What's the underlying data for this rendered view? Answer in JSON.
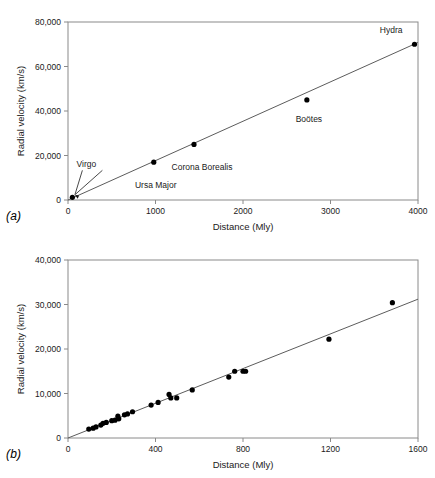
{
  "figure": {
    "panel_a_tag": "(a)",
    "panel_b_tag": "(b)"
  },
  "chart_data": [
    {
      "id": "a",
      "type": "scatter",
      "title": "",
      "xlabel": "Distance (Mly)",
      "ylabel": "Radial velocity (km/s)",
      "xlim": [
        0,
        4000
      ],
      "ylim": [
        0,
        80000
      ],
      "xticks": [
        0,
        1000,
        2000,
        3000,
        4000
      ],
      "xticklabels": [
        "0",
        "1000",
        "2000",
        "3000",
        "4000"
      ],
      "yticks": [
        0,
        20000,
        40000,
        60000,
        80000
      ],
      "yticklabels": [
        "0",
        "20,000",
        "40,000",
        "60,000",
        "80,000"
      ],
      "grid": false,
      "legend": "none",
      "points": [
        {
          "x": 50,
          "y": 1200,
          "label": "Virgo",
          "label_dx": 14,
          "label_dy": -30,
          "leader": true
        },
        {
          "x": 980,
          "y": 17000,
          "label": "Ursa Major",
          "label_dx": 2,
          "label_dy": 26,
          "leader": false
        },
        {
          "x": 1440,
          "y": 25000,
          "label": "Corona Borealis",
          "label_dx": 8,
          "label_dy": 26,
          "leader": false
        },
        {
          "x": 2730,
          "y": 45000,
          "label": "Boötes",
          "label_dx": 2,
          "label_dy": 22,
          "leader": false
        },
        {
          "x": 3960,
          "y": 70000,
          "label": "Hydra",
          "label_dx": -12,
          "label_dy": -11,
          "leader": false
        }
      ],
      "fit_line": {
        "x0": 0,
        "y0": 0,
        "x1": 4000,
        "y1": 70800
      }
    },
    {
      "id": "b",
      "type": "scatter",
      "title": "",
      "xlabel": "Distance (Mly)",
      "ylabel": "Radial velocity (km/s)",
      "xlim": [
        0,
        1600
      ],
      "ylim": [
        0,
        40000
      ],
      "xticks": [
        0,
        400,
        800,
        1200,
        1600
      ],
      "xticklabels": [
        "0",
        "400",
        "800",
        "1200",
        "1600"
      ],
      "yticks": [
        0,
        10000,
        20000,
        30000,
        40000
      ],
      "yticklabels": [
        "0",
        "10,000",
        "20,000",
        "30,000",
        "40,000"
      ],
      "grid": false,
      "legend": "none",
      "points": [
        {
          "x": 95,
          "y": 2000
        },
        {
          "x": 115,
          "y": 2200
        },
        {
          "x": 128,
          "y": 2500
        },
        {
          "x": 150,
          "y": 2900
        },
        {
          "x": 160,
          "y": 3300
        },
        {
          "x": 175,
          "y": 3500
        },
        {
          "x": 200,
          "y": 3900
        },
        {
          "x": 215,
          "y": 4000
        },
        {
          "x": 228,
          "y": 4900
        },
        {
          "x": 232,
          "y": 4300
        },
        {
          "x": 258,
          "y": 5200
        },
        {
          "x": 272,
          "y": 5400
        },
        {
          "x": 295,
          "y": 5900
        },
        {
          "x": 380,
          "y": 7400
        },
        {
          "x": 412,
          "y": 8000
        },
        {
          "x": 462,
          "y": 9800
        },
        {
          "x": 470,
          "y": 9000
        },
        {
          "x": 497,
          "y": 9000
        },
        {
          "x": 568,
          "y": 10800
        },
        {
          "x": 735,
          "y": 13700
        },
        {
          "x": 762,
          "y": 15000
        },
        {
          "x": 800,
          "y": 15000
        },
        {
          "x": 812,
          "y": 15000
        },
        {
          "x": 1193,
          "y": 22200
        },
        {
          "x": 1483,
          "y": 30400
        }
      ],
      "fit_line": {
        "x0": 0,
        "y0": 0,
        "x1": 1600,
        "y1": 31200
      }
    }
  ]
}
